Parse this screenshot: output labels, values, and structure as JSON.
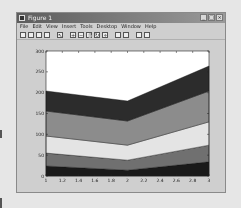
{
  "window": {
    "title": "Figure 1",
    "controls": {
      "minimize": "_",
      "maximize": "□",
      "close": "×"
    }
  },
  "menu": [
    "File",
    "Edit",
    "View",
    "Insert",
    "Tools",
    "Desktop",
    "Window",
    "Help"
  ],
  "toolbar": [
    {
      "name": "new-figure-icon",
      "glyph": ""
    },
    {
      "name": "open-file-icon",
      "glyph": ""
    },
    {
      "name": "save-icon",
      "glyph": ""
    },
    {
      "name": "print-icon",
      "glyph": ""
    },
    {
      "name": "sep"
    },
    {
      "name": "edit-plot-arrow-icon",
      "glyph": "↖"
    },
    {
      "name": "sep"
    },
    {
      "name": "zoom-in-icon",
      "glyph": "+"
    },
    {
      "name": "zoom-out-icon",
      "glyph": "−"
    },
    {
      "name": "pan-hand-icon",
      "glyph": "✋"
    },
    {
      "name": "rotate-3d-icon",
      "glyph": "↻"
    },
    {
      "name": "data-cursor-icon",
      "glyph": "⌖"
    },
    {
      "name": "sep"
    },
    {
      "name": "colorbar-icon",
      "glyph": ""
    },
    {
      "name": "legend-icon",
      "glyph": ""
    },
    {
      "name": "sep"
    },
    {
      "name": "hide-plot-tools-icon",
      "glyph": ""
    },
    {
      "name": "show-plot-tools-icon",
      "glyph": ""
    }
  ],
  "chart_data": {
    "type": "area",
    "stacked": true,
    "title": "",
    "xlabel": "",
    "ylabel": "",
    "x": [
      1,
      2,
      3
    ],
    "xlim": [
      1,
      3
    ],
    "ylim": [
      0,
      300
    ],
    "xticks": [
      "1",
      "1.2",
      "1.4",
      "1.6",
      "1.8",
      "2",
      "2.2",
      "2.4",
      "2.6",
      "2.8",
      "3"
    ],
    "yticks": [
      "0",
      "50",
      "100",
      "150",
      "200",
      "250",
      "300"
    ],
    "grid": false,
    "legend": "none",
    "series": [
      {
        "name": "Series 1",
        "values": [
          24,
          14,
          34
        ],
        "color": "#1a1a1a"
      },
      {
        "name": "Series 2",
        "values": [
          31,
          24,
          40
        ],
        "color": "#707070"
      },
      {
        "name": "Series 3",
        "values": [
          41,
          36,
          56
        ],
        "color": "#e4e4e4"
      },
      {
        "name": "Series 4",
        "values": [
          60,
          58,
          74
        ],
        "color": "#8c8c8c"
      },
      {
        "name": "Series 5",
        "values": [
          48,
          48,
          60
        ],
        "color": "#2c2c2c"
      }
    ]
  }
}
